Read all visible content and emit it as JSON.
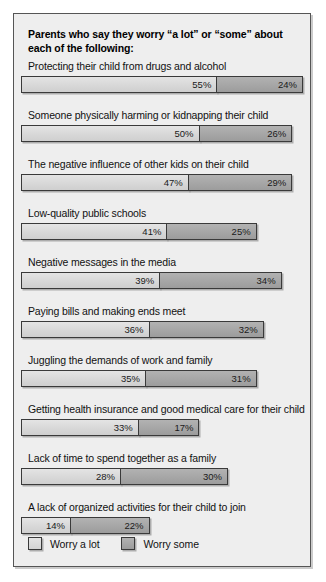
{
  "chart_data": {
    "type": "bar",
    "subtype": "stacked-horizontal",
    "title": "Parents who say they worry “a lot” or “some” about each of the following:",
    "xlabel": "",
    "ylabel": "",
    "grid": false,
    "legend_position": "bottom-left",
    "value_suffix": "%",
    "px_per_percent": 3.57,
    "xlim": [
      0,
      80
    ],
    "categories": [
      "Protecting their child from drugs and alcohol",
      "Someone physically harming or kidnapping their child",
      "The negative influence of other kids on their child",
      "Low-quality public schools",
      "Negative messages in the media",
      "Paying bills and making ends meet",
      "Juggling the demands of work and family",
      "Getting health insurance and good medical care for their child",
      "Lack of time to spend together as a family",
      "A lack of organized activities for their child to join"
    ],
    "series": [
      {
        "name": "Worry a lot",
        "color": "#d8d8d8",
        "values": [
          55,
          50,
          47,
          41,
          39,
          36,
          35,
          33,
          28,
          14
        ],
        "labels": [
          "55%",
          "50%",
          "47%",
          "41%",
          "39%",
          "36%",
          "35%",
          "33%",
          "28%",
          "14%"
        ]
      },
      {
        "name": "Worry some",
        "color": "#a6a6a6",
        "values": [
          24,
          26,
          29,
          25,
          34,
          32,
          31,
          17,
          30,
          22
        ],
        "labels": [
          "24%",
          "26%",
          "29%",
          "25%",
          "34%",
          "32%",
          "31%",
          "17%",
          "30%",
          "22%"
        ]
      }
    ],
    "totals": [
      79,
      76,
      76,
      66,
      73,
      68,
      66,
      50,
      58,
      36
    ]
  },
  "legend": {
    "items": [
      {
        "label": "Worry a lot",
        "swatch": "light-gray-swatch"
      },
      {
        "label": "Worry some",
        "swatch": "medium-gray-swatch"
      }
    ]
  },
  "colors": {
    "panel_background": "#eeeeee",
    "panel_border": "#555555",
    "page_background": "#ffffff",
    "series_a": "#d8d8d8",
    "series_b": "#a6a6a6",
    "bar_outline": "#3a3a3a",
    "text": "#111111"
  }
}
